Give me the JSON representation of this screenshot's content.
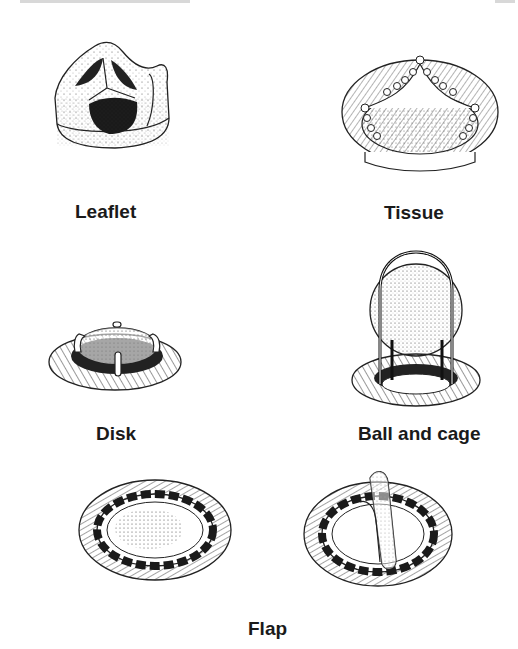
{
  "page": {
    "header_remnant": "cut-off running head (illegible)",
    "page_number_remnant": "illegible"
  },
  "figures": [
    {
      "id": "leaflet",
      "label": "Leaflet"
    },
    {
      "id": "tissue",
      "label": "Tissue"
    },
    {
      "id": "disk",
      "label": "Disk"
    },
    {
      "id": "ball-and-cage",
      "label": "Ball and cage"
    },
    {
      "id": "flap",
      "label": "Flap"
    }
  ],
  "colors": {
    "ink": "#1a1a1a",
    "paper": "#ffffff"
  }
}
